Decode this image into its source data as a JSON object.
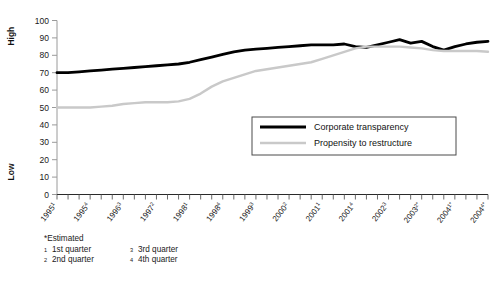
{
  "chart_data": {
    "type": "line",
    "title": "",
    "xlabel": "",
    "ylabel": "",
    "ylim": [
      0,
      100
    ],
    "ytick_values": [
      0,
      10,
      20,
      30,
      40,
      50,
      60,
      70,
      80,
      90,
      100
    ],
    "axis_scale_low_label": "Low",
    "axis_scale_high_label": "High",
    "grid": false,
    "legend_position": "inside-lower-right",
    "x": [
      "1995Q1",
      "1995Q2",
      "1995Q3",
      "1995Q4",
      "1996Q1",
      "1996Q2",
      "1996Q3",
      "1996Q4",
      "1997Q1",
      "1997Q2",
      "1997Q3",
      "1997Q4",
      "1998Q1",
      "1998Q2",
      "1998Q3",
      "1998Q4",
      "1999Q1",
      "1999Q2",
      "1999Q3",
      "1999Q4",
      "2000Q1",
      "2000Q2",
      "2000Q3",
      "2000Q4",
      "2001Q1",
      "2001Q2",
      "2001Q3",
      "2001Q4",
      "2002Q1",
      "2002Q2",
      "2002Q3",
      "2002Q4",
      "2003Q1",
      "2003Q2",
      "2003Q3",
      "2003Q4",
      "2004Q1",
      "2004Q2",
      "2004Q3",
      "2004Q4"
    ],
    "xtick_labels": [
      {
        "index": 0,
        "year": "1995",
        "sup": "1",
        "estimated": false
      },
      {
        "index": 3,
        "year": "1995",
        "sup": "4",
        "estimated": false
      },
      {
        "index": 6,
        "year": "1996",
        "sup": "3",
        "estimated": false
      },
      {
        "index": 9,
        "year": "1997",
        "sup": "2",
        "estimated": false
      },
      {
        "index": 12,
        "year": "1998",
        "sup": "1",
        "estimated": false
      },
      {
        "index": 15,
        "year": "1998",
        "sup": "4",
        "estimated": false
      },
      {
        "index": 18,
        "year": "1999",
        "sup": "3",
        "estimated": false
      },
      {
        "index": 21,
        "year": "2000",
        "sup": "2",
        "estimated": false
      },
      {
        "index": 24,
        "year": "2001",
        "sup": "1",
        "estimated": false
      },
      {
        "index": 27,
        "year": "2001",
        "sup": "4",
        "estimated": false
      },
      {
        "index": 30,
        "year": "2002",
        "sup": "3",
        "estimated": false
      },
      {
        "index": 33,
        "year": "2003",
        "sup": "2",
        "estimated": true
      },
      {
        "index": 36,
        "year": "2004",
        "sup": "1",
        "estimated": true
      },
      {
        "index": 39,
        "year": "2004",
        "sup": "4",
        "estimated": true
      }
    ],
    "series": [
      {
        "name": "Corporate transparency",
        "color": "#000000",
        "width": 2.8,
        "values": [
          70,
          70,
          70.5,
          71,
          71.5,
          72,
          72.5,
          73,
          73.5,
          74,
          74.5,
          75,
          76,
          77.5,
          79,
          80.5,
          82,
          83,
          83.5,
          84,
          84.5,
          85,
          85.5,
          86,
          86,
          86,
          86.5,
          85,
          84.5,
          86,
          87.5,
          89,
          87,
          88,
          85,
          83,
          85,
          86.5,
          87.5,
          88
        ]
      },
      {
        "name": "Propensity to restructure",
        "color": "#c9c9c9",
        "width": 2.4,
        "values": [
          50,
          50,
          50,
          50,
          50.5,
          51,
          52,
          52.5,
          53,
          53,
          53,
          53.5,
          55,
          58,
          62,
          65,
          67,
          69,
          71,
          72,
          73,
          74,
          75,
          76,
          78,
          80,
          82,
          84,
          85,
          85,
          85,
          85,
          84.5,
          84,
          83,
          82.5,
          82.5,
          82.5,
          82.5,
          82
        ]
      }
    ]
  },
  "legend": {
    "entries": [
      {
        "label": "Corporate transparency",
        "color": "#000000"
      },
      {
        "label": "Propensity to restructure",
        "color": "#c9c9c9"
      }
    ]
  },
  "footnotes": {
    "estimated": "*Estimated",
    "items": [
      {
        "mark": "1",
        "text": "1st quarter"
      },
      {
        "mark": "2",
        "text": "2nd quarter"
      },
      {
        "mark": "3",
        "text": "3rd quarter"
      },
      {
        "mark": "4",
        "text": "4th quarter"
      }
    ]
  }
}
